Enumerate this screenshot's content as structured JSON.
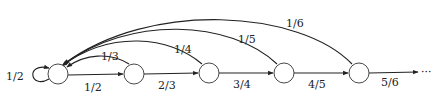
{
  "diagram": {
    "type": "state-transition-graph",
    "nodes": [
      {
        "id": "s0",
        "label": ""
      },
      {
        "id": "s1",
        "label": ""
      },
      {
        "id": "s2",
        "label": ""
      },
      {
        "id": "s3",
        "label": ""
      },
      {
        "id": "s4",
        "label": ""
      }
    ],
    "edges": {
      "self_loop": {
        "from": "s0",
        "to": "s0",
        "label": "1/2"
      },
      "forward": [
        {
          "from": "s0",
          "to": "s1",
          "label": "1/2"
        },
        {
          "from": "s1",
          "to": "s2",
          "label": "2/3"
        },
        {
          "from": "s2",
          "to": "s3",
          "label": "3/4"
        },
        {
          "from": "s3",
          "to": "s4",
          "label": "4/5"
        },
        {
          "from": "s4",
          "to": "continuation",
          "label": "5/6"
        }
      ],
      "back": [
        {
          "from": "s1",
          "to": "s0",
          "label": "1/3"
        },
        {
          "from": "s2",
          "to": "s0",
          "label": "1/4"
        },
        {
          "from": "s3",
          "to": "s0",
          "label": "1/5"
        },
        {
          "from": "s4",
          "to": "s0",
          "label": "1/6"
        }
      ]
    },
    "continuation_marker": "···"
  }
}
